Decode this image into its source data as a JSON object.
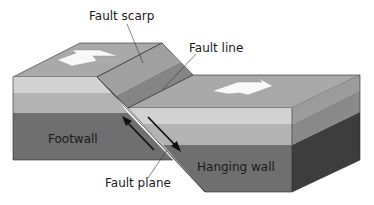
{
  "diagram": {
    "labels": {
      "fault_scarp": "Fault scarp",
      "fault_line": "Fault line",
      "footwall": "Footwall",
      "hanging_wall": "Hanging wall",
      "fault_plane": "Fault plane"
    },
    "colors": {
      "top_surface": "#a9a9a9",
      "layer_light": "#d2d2d2",
      "layer_mid": "#b3b3b3",
      "layer_dark": "#6f6f6f",
      "side_light": "#9c9c9c",
      "side_mid": "#8a8a8a",
      "side_dark": "#3d3d3d",
      "scarp_upper": "#a0a0a0",
      "scarp_lower": "#858585",
      "arrow_fill": "#f8f8f8",
      "outline": "#2a2a2a"
    },
    "arrows": [
      {
        "name": "extension-arrow-left",
        "direction": "left"
      },
      {
        "name": "extension-arrow-right",
        "direction": "right"
      },
      {
        "name": "footwall-motion-arrow",
        "direction": "up"
      },
      {
        "name": "hanging-wall-motion-arrow",
        "direction": "down"
      }
    ]
  }
}
